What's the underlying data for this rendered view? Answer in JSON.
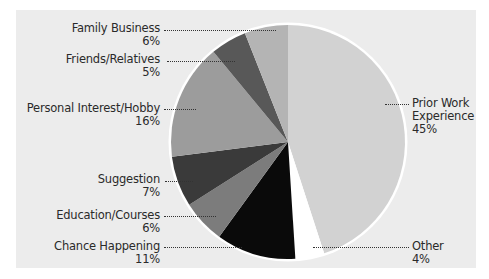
{
  "chart_data": {
    "type": "pie",
    "title": "",
    "categories": [
      "Prior Work Experience",
      "Other",
      "Chance Happening",
      "Education/Courses",
      "Suggestion",
      "Personal Interest/Hobby",
      "Friends/Relatives",
      "Family Business"
    ],
    "values": [
      45,
      4,
      11,
      6,
      7,
      16,
      5,
      6
    ],
    "unit": "%",
    "start_angle": "12 o'clock",
    "direction": "clockwise",
    "colors": [
      "#d2d2d2",
      "#ffffff",
      "#0a0a0a",
      "#7c7c7c",
      "#3a3a3a",
      "#9c9c9c",
      "#585858",
      "#b4b4b4"
    ],
    "legend": "none (leader-line labels)"
  },
  "labels": {
    "family_business": {
      "name": "Family Business",
      "value": "6%"
    },
    "friends_relatives": {
      "name": "Friends/Relatives",
      "value": "5%"
    },
    "personal_interest": {
      "name": "Personal Interest/Hobby",
      "value": "16%"
    },
    "suggestion": {
      "name": "Suggestion",
      "value": "7%"
    },
    "education": {
      "name": "Education/Courses",
      "value": "6%"
    },
    "chance": {
      "name": "Chance Happening",
      "value": "11%"
    },
    "prior_work_line1": "Prior Work",
    "prior_work_line2": "Experience",
    "prior_work_value": "45%",
    "other": {
      "name": "Other",
      "value": "4%"
    }
  },
  "colors": {
    "panel_bg": "#ececec",
    "pie_outline": "#ffffff",
    "leader": "#333333",
    "text": "#2a2a2a"
  }
}
